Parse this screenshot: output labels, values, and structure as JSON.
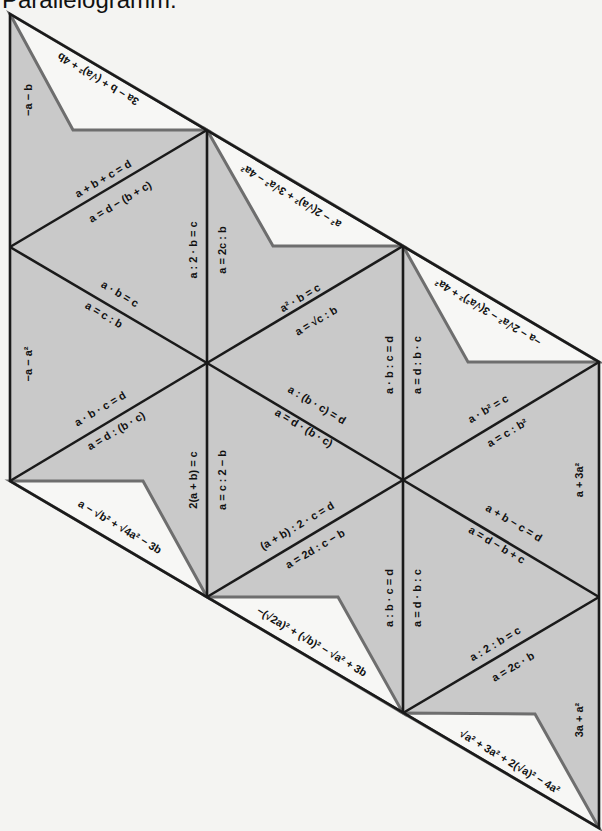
{
  "title": "Parallelogramm:",
  "colors": {
    "piece_fill": "#c9c9c9",
    "flap_fill": "#f7f7f5",
    "line": "#1a1a1a",
    "flap_edge": "#6e6e6e",
    "background": "#f4f4f2"
  },
  "edge_labels": {
    "left_top": "−a − b",
    "left_bottom": "−a − a²",
    "right_top": "a + 3a²",
    "right_bottom": "3a + a²"
  },
  "flaps": {
    "top_1": "3a − b + (√a)² + 4b",
    "top_2": "a² − 2(√a)² + 3√a² − 4a²",
    "top_3": "−a − 2√a² − 3(√a²)² + 4a²",
    "bottom_1": "a − √b² + √4a² − 3b",
    "bottom_2": "−(√2a)² + (√b)² − √a² + 3b",
    "bottom_3": "√a² + 3a² + 2(√a)² − 4a²"
  },
  "diagonals": {
    "c1_upper_a": "a + b + c = d",
    "c1_upper_b": "a = d − (b + c)",
    "c1_mid_a": "a · b = c",
    "c1_mid_b": "a = c : b",
    "c1_lower_a": "a · b · c = d",
    "c1_lower_b": "a = d : (b · c)",
    "c2_upper_a": "a² · b = c",
    "c2_upper_b": "a = √c : b",
    "c2_mid_a": "a : (b · c) = d",
    "c2_mid_b": "a = d · (b · c)",
    "c2_lower_a": "(a + b) : 2 · c = d",
    "c2_lower_b": "a = 2d : c − b",
    "c3_upper_a": "a · b² = c",
    "c3_upper_b": "a = c : b²",
    "c3_mid_a": "a + b − c = d",
    "c3_mid_b": "a = d − b + c",
    "c3_lower_a": "a : 2 : b = c",
    "c3_lower_b": "a = 2c · b"
  },
  "verticals": {
    "v1_upper_left": "a : 2 · b = c",
    "v1_upper_right": "a = 2c : b",
    "v1_lower_left": "2(a + b) = c",
    "v1_lower_right": "a = c : 2 − b",
    "v2_upper_left": "a · b : c = d",
    "v2_upper_right": "a = d : b · c",
    "v2_lower_left": "a : b · c = d",
    "v2_lower_right": "a = d · b : c"
  }
}
